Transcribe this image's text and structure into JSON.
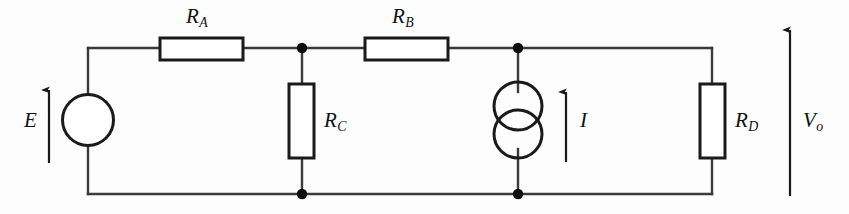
{
  "diagram": {
    "type": "electrical-circuit-schematic",
    "background_color": "#fdfdfd",
    "line_color": "#1a1a1a",
    "canvas": {
      "width": 849,
      "height": 214
    }
  },
  "components": {
    "voltage_source": {
      "id": "E",
      "label": "E",
      "symbol": "circle-with-arrow",
      "arrow_direction": "up",
      "position": {
        "x": 88,
        "y": 120
      }
    },
    "current_source": {
      "id": "I",
      "label": "I",
      "symbol": "double-overlapping-circle",
      "arrow_direction": "up",
      "position": {
        "x": 518,
        "y": 120
      }
    },
    "resistors": [
      {
        "id": "RA",
        "label": "R",
        "subscript": "A",
        "orientation": "horizontal",
        "box": {
          "x": 160,
          "y": 38,
          "width": 83,
          "height": 22
        },
        "label_position": {
          "x": 186,
          "y": 8
        }
      },
      {
        "id": "RB",
        "label": "R",
        "subscript": "B",
        "orientation": "horizontal",
        "box": {
          "x": 365,
          "y": 38,
          "width": 83,
          "height": 22
        },
        "label_position": {
          "x": 392,
          "y": 8
        }
      },
      {
        "id": "RC",
        "label": "R",
        "subscript": "C",
        "orientation": "vertical",
        "box": {
          "x": 289,
          "y": 84,
          "width": 25,
          "height": 74
        },
        "label_position": {
          "x": 324,
          "y": 116
        }
      },
      {
        "id": "RD",
        "label": "R",
        "subscript": "D",
        "orientation": "vertical",
        "box": {
          "x": 700,
          "y": 84,
          "width": 25,
          "height": 74
        },
        "label_position": {
          "x": 735,
          "y": 116
        }
      }
    ],
    "output_voltage": {
      "id": "Vo",
      "label": "V",
      "subscript": "o",
      "arrow_direction": "up",
      "arrow_line": {
        "x": 790,
        "y_top": 30,
        "y_bottom": 196
      },
      "label_position": {
        "x": 803,
        "y": 116
      }
    }
  },
  "labels": {
    "source_E": "E",
    "source_I": "I",
    "resistor_A": "R",
    "resistor_A_sub": "A",
    "resistor_B": "R",
    "resistor_B_sub": "B",
    "resistor_C": "R",
    "resistor_C_sub": "C",
    "resistor_D": "R",
    "resistor_D_sub": "D",
    "output_V": "V",
    "output_V_sub": "o"
  },
  "wiring": {
    "top_rail": {
      "y": 48,
      "x_start": 88,
      "x_end": 712
    },
    "bottom_rail": {
      "y": 194,
      "x_start": 88,
      "x_end": 712
    },
    "junction_nodes": [
      {
        "name": "node-rc-top",
        "x": 302,
        "y": 48
      },
      {
        "name": "node-rc-bottom",
        "x": 302,
        "y": 194
      },
      {
        "name": "node-is-top",
        "x": 518,
        "y": 48
      },
      {
        "name": "node-is-bottom",
        "x": 518,
        "y": 194
      }
    ]
  }
}
